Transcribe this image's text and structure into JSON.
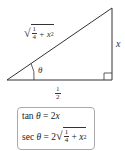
{
  "diagram": {
    "type": "right-triangle",
    "angle_label": "θ",
    "hypotenuse_label": {
      "sqrt_symbol": "√",
      "frac_num": "1",
      "frac_den": "4",
      "plus": "+",
      "var": "x",
      "exp": "2"
    },
    "opposite_label": "x",
    "adjacent_label": {
      "frac_num": "1",
      "frac_den": "2"
    }
  },
  "formulas": {
    "tan": {
      "func": "tan",
      "theta": "θ",
      "equals": "=",
      "rhs_coef": "2",
      "rhs_var": "x"
    },
    "sec": {
      "func": "sec",
      "theta": "θ",
      "equals": "=",
      "rhs_coef": "2",
      "sqrt_symbol": "√",
      "frac_num": "1",
      "frac_den": "4",
      "plus": "+",
      "var": "x",
      "exp": "2"
    }
  },
  "colors": {
    "line": "#333333",
    "box_border": "#aaaaaa"
  }
}
